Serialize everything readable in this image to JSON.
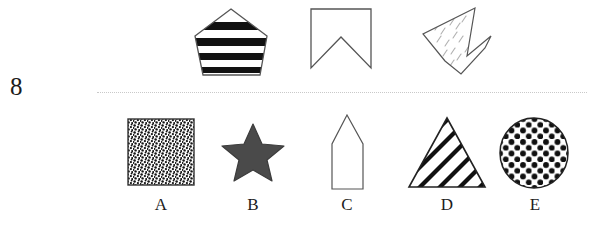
{
  "question": {
    "number": "8",
    "type": "visual-reasoning-shape-matching"
  },
  "divider": {
    "style": "dotted",
    "color": "#c9c9c9"
  },
  "stimulus": {
    "shapes": [
      {
        "id": "stimulus-1",
        "name": "striped-pentagon",
        "description": "Pentagon with thick horizontal black stripes",
        "fill_pattern": "horizontal-stripes",
        "outline_color": "#555555",
        "pattern_color": "#111111"
      },
      {
        "id": "stimulus-2",
        "name": "notched-banner",
        "description": "Banner / ribbon outline with V notch cut from the bottom edge",
        "fill_pattern": "none",
        "outline_color": "#555555",
        "pattern_color": "#555555"
      },
      {
        "id": "stimulus-3",
        "name": "checkmark-arrow",
        "description": "Rotated checkmark / arrow polygon with sparse dash hatching",
        "fill_pattern": "sparse-dashes",
        "outline_color": "#555555",
        "pattern_color": "#aaaaaa"
      }
    ]
  },
  "options": {
    "items": [
      {
        "letter": "A",
        "name": "speckled-square",
        "description": "Square filled with dense random speckle texture",
        "fill_pattern": "random-speckle",
        "outline_color": "#333333",
        "pattern_color": "#141414"
      },
      {
        "letter": "B",
        "name": "solid-star",
        "description": "Solid five-pointed star",
        "fill_pattern": "solid",
        "outline_color": "#3c3c3c",
        "pattern_color": "#4a4a4a"
      },
      {
        "letter": "C",
        "name": "pointed-pentagon",
        "description": "Narrow upright pentagon with pointed top, outline only",
        "fill_pattern": "none",
        "outline_color": "#555555",
        "pattern_color": "#555555"
      },
      {
        "letter": "D",
        "name": "striped-triangle",
        "description": "Triangle with diagonal stripes rising to the right",
        "fill_pattern": "diagonal-stripes",
        "outline_color": "#222222",
        "pattern_color": "#111111"
      },
      {
        "letter": "E",
        "name": "polka-dot-circle",
        "description": "Circle filled with a regular grid of black polka dots",
        "fill_pattern": "polka-dots",
        "outline_color": "#222222",
        "pattern_color": "#111111"
      }
    ]
  }
}
